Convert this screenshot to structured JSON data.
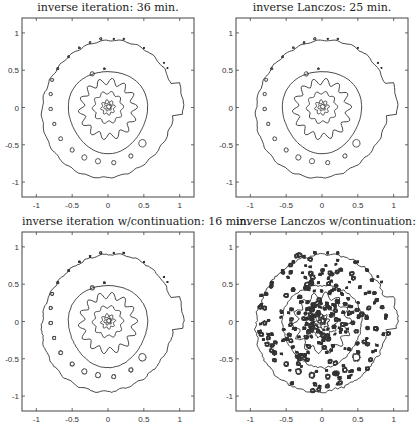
{
  "figure": {
    "panels": [
      {
        "id": "tl",
        "title": "inverse iteration: 36 min.",
        "noisy": false
      },
      {
        "id": "tr",
        "title": "inverse Lanczos: 25 min.",
        "noisy": false
      },
      {
        "id": "bl",
        "title": "inverse iteration w/continuation: 16 min.",
        "noisy": false
      },
      {
        "id": "br",
        "title": "inverse Lanczos w/continuation: 19 min.",
        "noisy": true
      }
    ]
  },
  "chart_data": [
    {
      "type": "contour",
      "title": "inverse iteration: 36 min.",
      "xlabel": "",
      "ylabel": "",
      "xlim": [
        -1.2,
        1.2
      ],
      "ylim": [
        -1.2,
        1.2
      ],
      "xticks": [
        "-1",
        "-0.5",
        "0",
        "0.5",
        "1"
      ],
      "yticks": [
        "-1",
        "-0.5",
        "0",
        "0.5",
        "1"
      ],
      "grid": false,
      "description": "Pseudospectra contour lines forming a spiral pattern with small circular contours along the spiral arm"
    },
    {
      "type": "contour",
      "title": "inverse Lanczos: 25 min.",
      "xlabel": "",
      "ylabel": "",
      "xlim": [
        -1.2,
        1.2
      ],
      "ylim": [
        -1.2,
        1.2
      ],
      "xticks": [
        "-1",
        "-0.5",
        "0",
        "0.5",
        "1"
      ],
      "yticks": [
        "-1",
        "-0.5",
        "0",
        "0.5",
        "1"
      ],
      "grid": false,
      "description": "Pseudospectra contour lines forming a spiral pattern, nearly identical to inverse iteration"
    },
    {
      "type": "contour",
      "title": "inverse iteration w/continuation: 16 min.",
      "xlabel": "",
      "ylabel": "",
      "xlim": [
        -1.2,
        1.2
      ],
      "ylim": [
        -1.2,
        1.2
      ],
      "xticks": [
        "-1",
        "-0.5",
        "0",
        "0.5",
        "1"
      ],
      "yticks": [
        "-1",
        "-0.5",
        "0",
        "0.5",
        "1"
      ],
      "grid": false,
      "description": "Spiral contours with slightly rougher outlines"
    },
    {
      "type": "contour",
      "title": "inverse Lanczos w/continuation: 19 min.",
      "xlabel": "",
      "ylabel": "",
      "xlim": [
        -1.2,
        1.2
      ],
      "ylim": [
        -1.2,
        1.2
      ],
      "xticks": [
        "-1",
        "-0.5",
        "0",
        "0.5",
        "1"
      ],
      "yticks": [
        "-1",
        "-0.5",
        "0",
        "0.5",
        "1"
      ],
      "grid": false,
      "description": "Spiral contours with many spurious small noisy contour artifacts"
    }
  ]
}
